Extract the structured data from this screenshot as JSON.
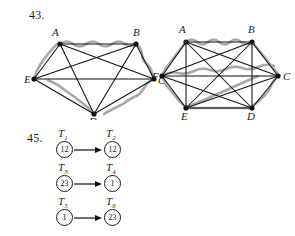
{
  "problems": [
    {
      "number": "43.",
      "figures": [
        {
          "id": "left-graph",
          "kind": "complete-graph",
          "vertex_count": 5,
          "vertices": [
            {
              "label": "A",
              "x": 36,
              "y": 22
            },
            {
              "label": "B",
              "x": 112,
              "y": 22
            },
            {
              "label": "E",
              "x": 10,
              "y": 57
            },
            {
              "label": "C",
              "x": 130,
              "y": 57
            },
            {
              "label": "D",
              "x": 70,
              "y": 92
            }
          ],
          "edges": [
            [
              "A",
              "B"
            ],
            [
              "A",
              "C"
            ],
            [
              "A",
              "D"
            ],
            [
              "A",
              "E"
            ],
            [
              "B",
              "C"
            ],
            [
              "B",
              "D"
            ],
            [
              "B",
              "E"
            ],
            [
              "C",
              "D"
            ],
            [
              "C",
              "E"
            ],
            [
              "D",
              "E"
            ]
          ],
          "highlighted_cycle": [
            "A",
            "B",
            "C",
            "D",
            "E",
            "A"
          ]
        },
        {
          "id": "right-graph",
          "kind": "complete-graph",
          "vertex_count": 6,
          "vertices": [
            {
              "label": "A",
              "x": 34,
              "y": 24
            },
            {
              "label": "B",
              "x": 100,
              "y": 24
            },
            {
              "label": "F",
              "x": 10,
              "y": 58
            },
            {
              "label": "C",
              "x": 126,
              "y": 58
            },
            {
              "label": "E",
              "x": 34,
              "y": 90
            },
            {
              "label": "D",
              "x": 100,
              "y": 90
            }
          ],
          "edges": [
            [
              "A",
              "B"
            ],
            [
              "A",
              "C"
            ],
            [
              "A",
              "D"
            ],
            [
              "A",
              "E"
            ],
            [
              "A",
              "F"
            ],
            [
              "B",
              "C"
            ],
            [
              "B",
              "D"
            ],
            [
              "B",
              "E"
            ],
            [
              "B",
              "F"
            ],
            [
              "C",
              "D"
            ],
            [
              "C",
              "E"
            ],
            [
              "C",
              "F"
            ],
            [
              "D",
              "E"
            ],
            [
              "D",
              "F"
            ],
            [
              "E",
              "F"
            ]
          ],
          "highlighted_cycle": [
            "A",
            "B",
            "C",
            "D",
            "E",
            "F",
            "A"
          ]
        }
      ]
    },
    {
      "number": "45.",
      "rows": [
        {
          "source": {
            "name": "T",
            "subscript": "1",
            "value": "12"
          },
          "target": {
            "name": "T",
            "subscript": "2",
            "value": "12"
          }
        },
        {
          "source": {
            "name": "T",
            "subscript": "3",
            "value": "23"
          },
          "target": {
            "name": "T",
            "subscript": "4",
            "value": "1"
          }
        },
        {
          "source": {
            "name": "T",
            "subscript": "5",
            "value": "1"
          },
          "target": {
            "name": "T",
            "subscript": "6",
            "value": "23"
          }
        }
      ]
    }
  ],
  "colors": {
    "ink": "#1c1c1c",
    "edge": "#111111",
    "highlight": "#9a9a9a",
    "paper": "#ffffff"
  }
}
